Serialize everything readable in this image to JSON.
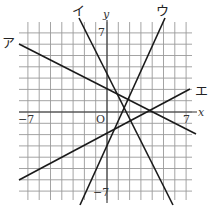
{
  "graph": {
    "origin_label": "O",
    "x_axis_label": "x",
    "y_axis_label": "y",
    "tick_labels": {
      "x_neg": "−7",
      "x_pos": "7",
      "y_pos": "7",
      "y_neg": "−7"
    },
    "range": {
      "x": [
        -8,
        8
      ],
      "y": [
        -8,
        8
      ]
    },
    "lines": [
      {
        "label": "ア",
        "equation": "y = -1/2 x + 2",
        "slope": -0.5,
        "intercept": 2
      },
      {
        "label": "イ",
        "equation": "y = -2x + 3",
        "slope": -2,
        "intercept": 3
      },
      {
        "label": "ウ",
        "equation": "y = 2x - 2",
        "slope": 2,
        "intercept": -2
      },
      {
        "label": "エ",
        "equation": "y = 1/2 x - 2",
        "slope": 0.5,
        "intercept": -2
      }
    ]
  },
  "colors": {
    "grid": "#9a9a9a",
    "line": "#1a1a1a",
    "background": "#ffffff"
  }
}
